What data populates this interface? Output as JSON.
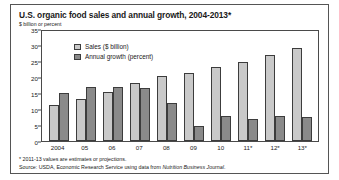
{
  "figure": {
    "title": "U.S. organic food sales and annual growth, 2004-2013*",
    "unit_label": "$ billion or percent",
    "footnote": "* 2011-13 values are estimates or projections.",
    "source_prefix": "Source: USDA, Economic Research Service using data from ",
    "source_italic": "Nutrition Business Journal",
    "source_suffix": "."
  },
  "colors": {
    "sales": "#c9c9c9",
    "growth": "#8a8a8a",
    "outline": "#3c3c3c",
    "frame": "#4a4a4a"
  },
  "chart_data": {
    "type": "bar",
    "title": "U.S. organic food sales and annual growth, 2004-2013*",
    "xlabel": "",
    "ylabel": "$ billion or percent",
    "ylim": [
      0,
      35
    ],
    "yticks": [
      0,
      5,
      10,
      15,
      20,
      25,
      30,
      35
    ],
    "grid": false,
    "legend_position": "upper-left-inside",
    "categories": [
      "2004",
      "05",
      "06",
      "07",
      "08",
      "09",
      "10",
      "11*",
      "12*",
      "13*"
    ],
    "series": [
      {
        "name": "Sales ($ billion)",
        "values": [
          11.2,
          13.2,
          15.4,
          18.2,
          20.3,
          21.4,
          23.0,
          24.8,
          26.8,
          29.0
        ]
      },
      {
        "name": "Annual growth (percent)",
        "values": [
          15.0,
          17.0,
          16.8,
          16.7,
          11.8,
          4.8,
          7.8,
          6.8,
          7.7,
          7.6
        ]
      }
    ]
  }
}
